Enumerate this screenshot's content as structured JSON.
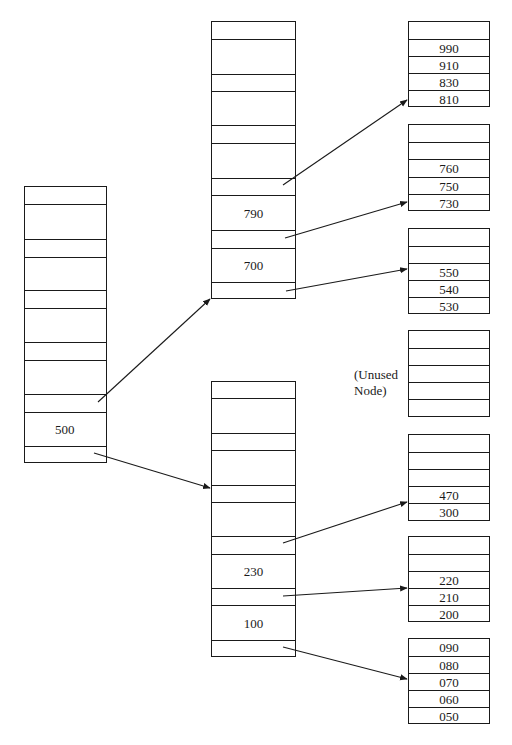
{
  "diagram": {
    "type": "b-tree",
    "root": {
      "keys": [
        "500"
      ]
    },
    "internal_nodes": [
      {
        "id": "upper",
        "keys": [
          "790",
          "700"
        ]
      },
      {
        "id": "lower",
        "keys": [
          "230",
          "100"
        ]
      }
    ],
    "leaf_nodes": [
      {
        "id": "leaf1",
        "keys": [
          "",
          "990",
          "910",
          "830",
          "810"
        ]
      },
      {
        "id": "leaf2",
        "keys": [
          "",
          "",
          "760",
          "750",
          "730"
        ]
      },
      {
        "id": "leaf3",
        "keys": [
          "",
          "",
          "550",
          "540",
          "530"
        ]
      },
      {
        "id": "leaf4",
        "keys": [
          "",
          "",
          "",
          "",
          ""
        ]
      },
      {
        "id": "leaf5",
        "keys": [
          "",
          "",
          "",
          "470",
          "300"
        ]
      },
      {
        "id": "leaf6",
        "keys": [
          "",
          "",
          "220",
          "210",
          "200"
        ]
      },
      {
        "id": "leaf7",
        "keys": [
          "090",
          "080",
          "070",
          "060",
          "050"
        ]
      }
    ],
    "annotations": {
      "unused_line1": "(Unused",
      "unused_line2": "Node)"
    }
  }
}
